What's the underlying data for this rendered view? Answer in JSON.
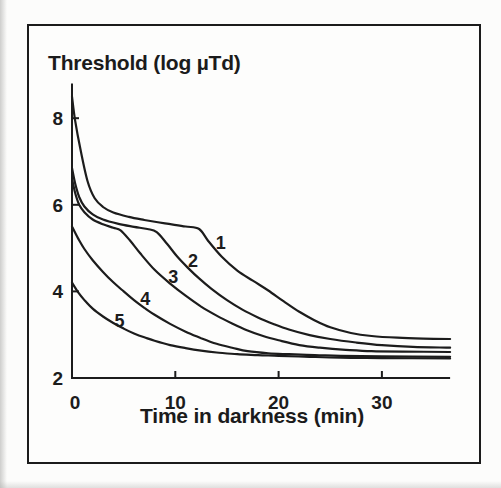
{
  "figure": {
    "background": "#fcfcfb",
    "frame_color": "#1b1b1b",
    "ink_color": "#1c1c1c"
  },
  "chart_data": {
    "type": "line",
    "title": "Threshold (log µTd)",
    "xlabel": "Time in darkness (min)",
    "ylabel": "Threshold (log µTd)",
    "xlim": [
      0,
      36.6
    ],
    "ylim": [
      2,
      8.8
    ],
    "x_ticks": [
      0,
      10,
      20,
      30
    ],
    "y_ticks": [
      2,
      4,
      6,
      8
    ],
    "grid": false,
    "legend_position": "none",
    "series": [
      {
        "name": "1",
        "label": {
          "text": "1",
          "x": 14.4,
          "y": 5.15
        },
        "points": [
          [
            0,
            8.5
          ],
          [
            0.3,
            7.95
          ],
          [
            0.8,
            7.3
          ],
          [
            1.5,
            6.55
          ],
          [
            2.2,
            6.15
          ],
          [
            3,
            5.95
          ],
          [
            4,
            5.82
          ],
          [
            5.5,
            5.72
          ],
          [
            7,
            5.65
          ],
          [
            9,
            5.57
          ],
          [
            11,
            5.5
          ],
          [
            12.3,
            5.44
          ],
          [
            13.2,
            5.16
          ],
          [
            14.5,
            4.8
          ],
          [
            16,
            4.48
          ],
          [
            17.5,
            4.25
          ],
          [
            19,
            4.02
          ],
          [
            20.5,
            3.77
          ],
          [
            22,
            3.53
          ],
          [
            23.5,
            3.33
          ],
          [
            25,
            3.17
          ],
          [
            27,
            3.04
          ],
          [
            29,
            2.97
          ],
          [
            31.5,
            2.93
          ],
          [
            34,
            2.91
          ],
          [
            36.6,
            2.9
          ]
        ]
      },
      {
        "name": "2",
        "label": {
          "text": "2",
          "x": 11.7,
          "y": 4.73
        },
        "points": [
          [
            0,
            6.85
          ],
          [
            0.3,
            6.5
          ],
          [
            0.7,
            6.18
          ],
          [
            1.2,
            5.96
          ],
          [
            2,
            5.78
          ],
          [
            3,
            5.66
          ],
          [
            4.5,
            5.56
          ],
          [
            6,
            5.49
          ],
          [
            7.3,
            5.44
          ],
          [
            8.2,
            5.37
          ],
          [
            9.2,
            5.1
          ],
          [
            10.2,
            4.8
          ],
          [
            11.2,
            4.55
          ],
          [
            12.3,
            4.3
          ],
          [
            13.5,
            4.06
          ],
          [
            15,
            3.8
          ],
          [
            16.5,
            3.58
          ],
          [
            18,
            3.4
          ],
          [
            19.5,
            3.25
          ],
          [
            21,
            3.12
          ],
          [
            23,
            2.99
          ],
          [
            25,
            2.9
          ],
          [
            27.5,
            2.82
          ],
          [
            30,
            2.76
          ],
          [
            33,
            2.72
          ],
          [
            36.6,
            2.7
          ]
        ]
      },
      {
        "name": "3",
        "label": {
          "text": "3",
          "x": 9.8,
          "y": 4.36
        },
        "points": [
          [
            0,
            6.6
          ],
          [
            0.3,
            6.28
          ],
          [
            0.7,
            6.0
          ],
          [
            1.2,
            5.83
          ],
          [
            2,
            5.66
          ],
          [
            3,
            5.55
          ],
          [
            4,
            5.47
          ],
          [
            4.7,
            5.41
          ],
          [
            5.6,
            5.18
          ],
          [
            6.6,
            4.88
          ],
          [
            8,
            4.5
          ],
          [
            9.5,
            4.18
          ],
          [
            11,
            3.9
          ],
          [
            12.5,
            3.65
          ],
          [
            14,
            3.44
          ],
          [
            15.5,
            3.26
          ],
          [
            17,
            3.1
          ],
          [
            18.5,
            2.97
          ],
          [
            20,
            2.87
          ],
          [
            22,
            2.76
          ],
          [
            24,
            2.7
          ],
          [
            26.5,
            2.65
          ],
          [
            29,
            2.62
          ],
          [
            32,
            2.61
          ],
          [
            36.6,
            2.6
          ]
        ]
      },
      {
        "name": "4",
        "label": {
          "text": "4",
          "x": 7.1,
          "y": 3.85
        },
        "points": [
          [
            0,
            5.5
          ],
          [
            0.6,
            5.22
          ],
          [
            1.2,
            4.98
          ],
          [
            2,
            4.72
          ],
          [
            3,
            4.45
          ],
          [
            4,
            4.21
          ],
          [
            5,
            4.0
          ],
          [
            6,
            3.8
          ],
          [
            7,
            3.62
          ],
          [
            8,
            3.46
          ],
          [
            9.5,
            3.25
          ],
          [
            11,
            3.07
          ],
          [
            12.5,
            2.92
          ],
          [
            14,
            2.79
          ],
          [
            15.5,
            2.7
          ],
          [
            17,
            2.62
          ],
          [
            19,
            2.57
          ],
          [
            21,
            2.55
          ],
          [
            23.5,
            2.53
          ],
          [
            26,
            2.51
          ],
          [
            30,
            2.5
          ],
          [
            36.6,
            2.49
          ]
        ]
      },
      {
        "name": "5",
        "label": {
          "text": "5",
          "x": 4.6,
          "y": 3.34
        },
        "points": [
          [
            0,
            4.2
          ],
          [
            0.6,
            3.98
          ],
          [
            1.2,
            3.8
          ],
          [
            2,
            3.6
          ],
          [
            3,
            3.42
          ],
          [
            4,
            3.27
          ],
          [
            5,
            3.14
          ],
          [
            6,
            3.03
          ],
          [
            7,
            2.94
          ],
          [
            8,
            2.86
          ],
          [
            9.5,
            2.76
          ],
          [
            11,
            2.69
          ],
          [
            12.5,
            2.63
          ],
          [
            14,
            2.59
          ],
          [
            16,
            2.55
          ],
          [
            18,
            2.53
          ],
          [
            20,
            2.51
          ],
          [
            23,
            2.49
          ],
          [
            26,
            2.47
          ],
          [
            30,
            2.46
          ],
          [
            36.6,
            2.45
          ]
        ]
      }
    ]
  }
}
